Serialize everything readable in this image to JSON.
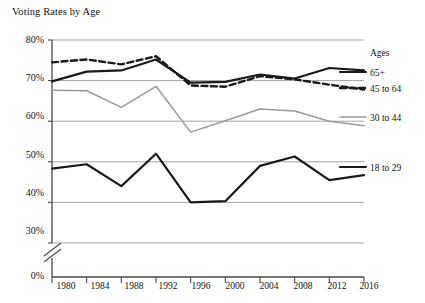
{
  "chart_data": {
    "type": "line",
    "title": "Voting Rates by Age",
    "xlabel": "",
    "ylabel": "",
    "x": [
      1980,
      1984,
      1988,
      1992,
      1996,
      2000,
      2004,
      2008,
      2012,
      2016
    ],
    "categories": [
      "1980",
      "1984",
      "1988",
      "1992",
      "1996",
      "2000",
      "2004",
      "2008",
      "2012",
      "2016"
    ],
    "ylim": [
      30,
      80
    ],
    "y_ticks": [
      30,
      40,
      50,
      60,
      70,
      80
    ],
    "y_tick_labels": [
      "30%",
      "40%",
      "50%",
      "60%",
      "70%",
      "80%"
    ],
    "y_zero_label": "0%",
    "axis_break": true,
    "grid": true,
    "grid_orientation": "horizontal",
    "legend_position": "right",
    "legend_title": "Ages",
    "series": [
      {
        "name": "65+",
        "style": "solid",
        "color": "#1a1a1a",
        "width": 2.2,
        "values": [
          69.8,
          72.2,
          72.5,
          75.2,
          69.5,
          69.7,
          71.5,
          70.5,
          73.1,
          72.5
        ]
      },
      {
        "name": "45 to 64",
        "style": "dashed",
        "color": "#1a1a1a",
        "width": 2.4,
        "values": [
          74.5,
          75.2,
          74.0,
          76.0,
          68.8,
          68.5,
          71.1,
          70.3,
          69.0,
          67.8
        ]
      },
      {
        "name": "30 to 44",
        "style": "solid",
        "color": "#9a9a9a",
        "width": 1.5,
        "values": [
          67.6,
          67.5,
          63.4,
          68.6,
          57.3,
          60.1,
          63.0,
          62.5,
          60.0,
          58.9
        ]
      },
      {
        "name": "18 to 29",
        "style": "solid",
        "color": "#1a1a1a",
        "width": 2.2,
        "values": [
          48.3,
          49.4,
          44.0,
          52.0,
          40.0,
          40.3,
          49.0,
          51.3,
          45.5,
          46.7
        ]
      }
    ]
  },
  "legend": {
    "title": "Ages",
    "entries": [
      {
        "label": "65+",
        "color": "#1a1a1a",
        "style": "solid"
      },
      {
        "label": "45 to 64",
        "color": "#1a1a1a",
        "style": "dashed"
      },
      {
        "label": "30 to 44",
        "color": "#9a9a9a",
        "style": "solid"
      },
      {
        "label": "18 to 29",
        "color": "#1a1a1a",
        "style": "solid"
      }
    ]
  },
  "colors": {
    "axis": "#4a4a4a",
    "grid": "#9a9a9a",
    "text": "#141414",
    "series_dark": "#1a1a1a",
    "series_gray": "#9a9a9a",
    "background": "#ffffff"
  }
}
